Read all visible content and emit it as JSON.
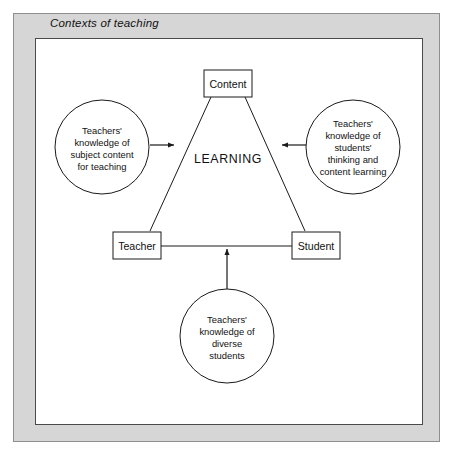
{
  "frame": {
    "title": "Contexts of teaching"
  },
  "diagram": {
    "center_label": "LEARNING",
    "boxes": [
      {
        "id": "content",
        "label": "Content"
      },
      {
        "id": "teacher",
        "label": "Teacher"
      },
      {
        "id": "student",
        "label": "Student"
      }
    ],
    "circles": [
      {
        "id": "subject-content-knowledge",
        "lines": [
          "Teachers'",
          "knowledge of",
          "subject content",
          "for teaching"
        ]
      },
      {
        "id": "student-thinking-knowledge",
        "lines": [
          "Teachers'",
          "knowledge of",
          "students'",
          "thinking and",
          "content learning"
        ]
      },
      {
        "id": "diverse-students-knowledge",
        "lines": [
          "Teachers'",
          "knowledge of",
          "diverse",
          "students"
        ]
      }
    ],
    "arrows": [
      {
        "id": "left-to-center",
        "direction": "right"
      },
      {
        "id": "right-to-center",
        "direction": "left"
      },
      {
        "id": "bottom-to-center",
        "direction": "up"
      }
    ],
    "colors": {
      "frame_fill": "#d6d6d6",
      "frame_border": "#8e8e8e",
      "panel_fill": "#ffffff",
      "panel_border": "#4a4a4a",
      "stroke": "#1a1a1a",
      "text": "#111111"
    }
  }
}
